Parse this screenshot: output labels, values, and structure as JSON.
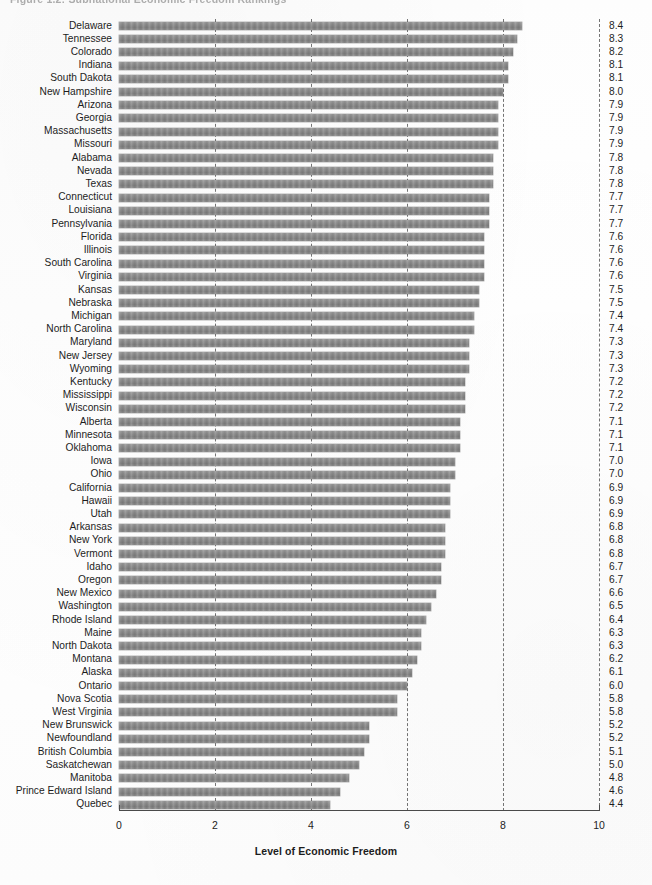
{
  "figure": {
    "caption_fragment": "Figure 1.2: Subnational Economic Freedom Rankings",
    "xlabel": "Level of Economic Freedom",
    "bar_color": "#8a8a8a",
    "gridline_color": "#5d5d5d",
    "axis_color": "#4a4a4a"
  },
  "chart_data": {
    "type": "bar",
    "orientation": "horizontal",
    "title": "",
    "xlabel": "Level of Economic Freedom",
    "ylabel": "",
    "xlim": [
      0,
      10
    ],
    "xticks": [
      "0",
      "2",
      "4",
      "6",
      "8",
      "10"
    ],
    "grid": "vertical-dashed",
    "legend": "none",
    "value_labels": true,
    "categories": [
      "Delaware",
      "Tennessee",
      "Colorado",
      "Indiana",
      "South Dakota",
      "New Hampshire",
      "Arizona",
      "Georgia",
      "Massachusetts",
      "Missouri",
      "Alabama",
      "Nevada",
      "Texas",
      "Connecticut",
      "Louisiana",
      "Pennsylvania",
      "Florida",
      "Illinois",
      "South Carolina",
      "Virginia",
      "Kansas",
      "Nebraska",
      "Michigan",
      "North Carolina",
      "Maryland",
      "New Jersey",
      "Wyoming",
      "Kentucky",
      "Mississippi",
      "Wisconsin",
      "Alberta",
      "Minnesota",
      "Oklahoma",
      "Iowa",
      "Ohio",
      "California",
      "Hawaii",
      "Utah",
      "Arkansas",
      "New York",
      "Vermont",
      "Idaho",
      "Oregon",
      "New Mexico",
      "Washington",
      "Rhode Island",
      "Maine",
      "North Dakota",
      "Montana",
      "Alaska",
      "Ontario",
      "Nova Scotia",
      "West Virginia",
      "New Brunswick",
      "Newfoundland",
      "British Columbia",
      "Saskatchewan",
      "Manitoba",
      "Prince Edward Island",
      "Quebec"
    ],
    "values": [
      8.4,
      8.3,
      8.2,
      8.1,
      8.1,
      8.0,
      7.9,
      7.9,
      7.9,
      7.9,
      7.8,
      7.8,
      7.8,
      7.7,
      7.7,
      7.7,
      7.6,
      7.6,
      7.6,
      7.6,
      7.5,
      7.5,
      7.4,
      7.4,
      7.3,
      7.3,
      7.3,
      7.2,
      7.2,
      7.2,
      7.1,
      7.1,
      7.1,
      7.0,
      7.0,
      6.9,
      6.9,
      6.9,
      6.8,
      6.8,
      6.8,
      6.7,
      6.7,
      6.6,
      6.5,
      6.4,
      6.3,
      6.3,
      6.2,
      6.1,
      6.0,
      5.8,
      5.8,
      5.2,
      5.2,
      5.1,
      5.0,
      4.8,
      4.6,
      4.4
    ],
    "value_label_strings": [
      "8.4",
      "8.3",
      "8.2",
      "8.1",
      "8.1",
      "8.0",
      "7.9",
      "7.9",
      "7.9",
      "7.9",
      "7.8",
      "7.8",
      "7.8",
      "7.7",
      "7.7",
      "7.7",
      "7.6",
      "7.6",
      "7.6",
      "7.6",
      "7.5",
      "7.5",
      "7.4",
      "7.4",
      "7.3",
      "7.3",
      "7.3",
      "7.2",
      "7.2",
      "7.2",
      "7.1",
      "7.1",
      "7.1",
      "7.0",
      "7.0",
      "6.9",
      "6.9",
      "6.9",
      "6.8",
      "6.8",
      "6.8",
      "6.7",
      "6.7",
      "6.6",
      "6.5",
      "6.4",
      "6.3",
      "6.3",
      "6.2",
      "6.1",
      "6.0",
      "5.8",
      "5.8",
      "5.2",
      "5.2",
      "5.1",
      "5.0",
      "4.8",
      "4.6",
      "4.4"
    ]
  }
}
